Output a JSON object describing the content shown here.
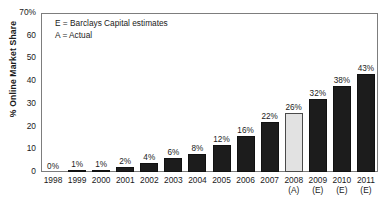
{
  "title": "",
  "legend": {
    "line1": "E = Barclays Capital estimates",
    "line2": "A = Actual"
  },
  "axis": {
    "ylabel": "% Online Market Share",
    "yticks": [
      "70%",
      "60",
      "50",
      "40",
      "30",
      "20",
      "10",
      "0"
    ]
  },
  "colors": {
    "bar_estimate": "#1c1c1c",
    "bar_actual": "#e2e2e2",
    "frame": "#7d7d7d",
    "background": "#ffffff"
  },
  "chart_data": {
    "type": "bar",
    "title": "",
    "xlabel": "",
    "ylabel": "% Online Market Share",
    "ylim": [
      0,
      70
    ],
    "yticks": [
      0,
      10,
      20,
      30,
      40,
      50,
      60,
      70
    ],
    "grid": false,
    "legend_position": "top-left",
    "categories": [
      "1998",
      "1999",
      "2000",
      "2001",
      "2002",
      "2003",
      "2004",
      "2005",
      "2006",
      "2007",
      "2008",
      "2009",
      "2010",
      "2011"
    ],
    "values": [
      0,
      1,
      1,
      2,
      4,
      6,
      8,
      12,
      16,
      22,
      26,
      32,
      38,
      43
    ],
    "data_labels": [
      "0%",
      "1%",
      "1%",
      "2%",
      "4%",
      "6%",
      "8%",
      "12%",
      "16%",
      "22%",
      "26%",
      "32%",
      "38%",
      "43%"
    ],
    "category_notes": [
      "",
      "",
      "",
      "",
      "",
      "",
      "",
      "",
      "",
      "",
      "(A)",
      "(E)",
      "(E)",
      "(E)"
    ],
    "bar_kinds": [
      "dark",
      "dark",
      "dark",
      "dark",
      "dark",
      "dark",
      "dark",
      "dark",
      "dark",
      "dark",
      "light",
      "dark",
      "dark",
      "dark"
    ],
    "annotations": [
      "E = Barclays Capital estimates",
      "A = Actual"
    ]
  }
}
